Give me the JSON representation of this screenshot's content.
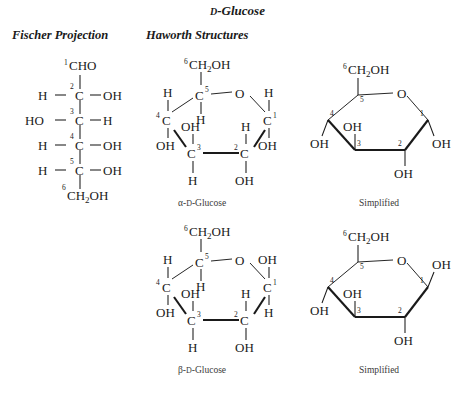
{
  "title": {
    "prefix": "D",
    "rest": "-Glucose"
  },
  "headers": {
    "fischer": "Fischer Projection",
    "haworth": "Haworth Structures"
  },
  "captions": {
    "alpha_full": {
      "prefix": "α-",
      "sc": "D",
      "rest": "-Glucose"
    },
    "alpha_simplified": "Simplified",
    "beta_full": {
      "prefix": "β-",
      "sc": "D",
      "rest": "-Glucose"
    },
    "beta_simplified": "Simplified"
  },
  "labels": {
    "C": "C",
    "O": "O",
    "H": "H",
    "OH": "OH",
    "HO": "HO",
    "CHO": "CHO",
    "CH2OH_pre": "CH",
    "CH2OH_sub": "2",
    "CH2OH_post": "OH",
    "n1": "1",
    "n2": "2",
    "n3": "3",
    "n4": "4",
    "n5": "5",
    "n6": "6"
  },
  "fischer": {
    "name": "Fischer projection of D-glucose",
    "carbons": [
      {
        "number": "1",
        "label": "CHO",
        "left": "",
        "right": ""
      },
      {
        "number": "2",
        "label": "C",
        "left": "H",
        "right": "OH"
      },
      {
        "number": "3",
        "label": "C",
        "left": "HO",
        "right": "H"
      },
      {
        "number": "4",
        "label": "C",
        "left": "H",
        "right": "OH"
      },
      {
        "number": "5",
        "label": "C",
        "left": "H",
        "right": "OH"
      },
      {
        "number": "6",
        "label": "CH2OH",
        "left": "",
        "right": ""
      }
    ]
  },
  "haworth": {
    "alpha": {
      "anomer": "alpha",
      "ring_oxygen": "O",
      "substituents": [
        {
          "carbon": "1",
          "up": "H",
          "down": "OH"
        },
        {
          "carbon": "2",
          "up": "H",
          "down": "OH"
        },
        {
          "carbon": "3",
          "up": "OH",
          "down": "H"
        },
        {
          "carbon": "4",
          "up": "H",
          "down": "OH"
        },
        {
          "carbon": "5",
          "up": "CH2OH",
          "down": "H"
        }
      ]
    },
    "beta": {
      "anomer": "beta",
      "ring_oxygen": "O",
      "substituents": [
        {
          "carbon": "1",
          "up": "OH",
          "down": "H"
        },
        {
          "carbon": "2",
          "up": "H",
          "down": "OH"
        },
        {
          "carbon": "3",
          "up": "OH",
          "down": "H"
        },
        {
          "carbon": "4",
          "up": "H",
          "down": "OH"
        },
        {
          "carbon": "5",
          "up": "CH2OH",
          "down": "H"
        }
      ]
    }
  },
  "colors": {
    "ink": "#1a1a1a",
    "caption": "#3a3a3a",
    "background": "#ffffff"
  }
}
